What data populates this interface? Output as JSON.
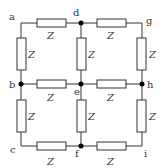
{
  "diagram": {
    "type": "resistor-grid-network",
    "colors": {
      "line": "#333333",
      "dot": "#000000",
      "background": "#ffffff"
    },
    "nodes": {
      "a": {
        "label": "a",
        "x": 21,
        "y": 23,
        "dot": false
      },
      "d": {
        "label": "d",
        "x": 81,
        "y": 23,
        "dot": true
      },
      "g": {
        "label": "g",
        "x": 142,
        "y": 23,
        "dot": false
      },
      "b": {
        "label": "b",
        "x": 21,
        "y": 84,
        "dot": true
      },
      "e": {
        "label": "e",
        "x": 81,
        "y": 84,
        "dot": true
      },
      "h": {
        "label": "h",
        "x": 142,
        "y": 84,
        "dot": true
      },
      "c": {
        "label": "c",
        "x": 21,
        "y": 146,
        "dot": false
      },
      "f": {
        "label": "f",
        "x": 81,
        "y": 146,
        "dot": true
      },
      "i": {
        "label": "i",
        "x": 142,
        "y": 146,
        "dot": false
      }
    },
    "impedances": {
      "a_d": "Z",
      "d_g": "Z",
      "b_e": "Z",
      "e_h": "Z",
      "c_f": "Z",
      "f_i": "Z",
      "a_b": "Z",
      "b_c": "Z",
      "d_e": "Z",
      "e_f": "Z",
      "g_h": "Z",
      "h_i": "Z"
    }
  }
}
